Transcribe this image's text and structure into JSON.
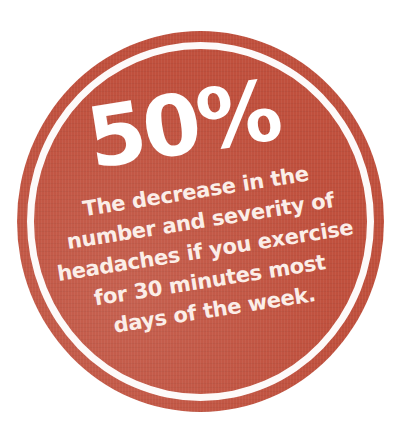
{
  "badge": {
    "statistic": "50%",
    "caption_lines": [
      "The decrease in the",
      "number and severity of",
      "headaches if you exercise",
      "for 30 minutes most",
      "days of the week."
    ],
    "colors": {
      "fill": "#c0503d",
      "ring": "#ffffff",
      "text": "#ffffff",
      "background": "#ffffff"
    }
  }
}
